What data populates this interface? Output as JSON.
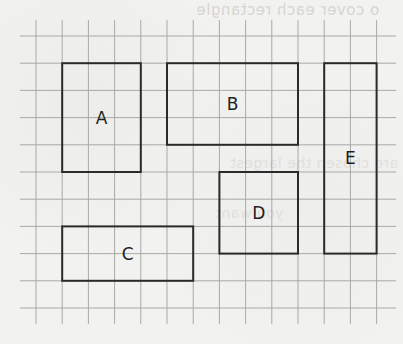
{
  "figure": {
    "type": "grid-diagram",
    "grid": {
      "columns": 14,
      "rows": 10,
      "cell_size_px": 26.2,
      "origin_px": [
        36,
        36
      ],
      "line_color": "#a9a9a6",
      "shape_stroke_color": "#2b2b2b",
      "background_color": "#f2f2f0"
    },
    "shapes": [
      {
        "label": "A",
        "col": 1,
        "row": 1,
        "width_cells": 3,
        "height_cells": 4
      },
      {
        "label": "B",
        "col": 5,
        "row": 1,
        "width_cells": 5,
        "height_cells": 3
      },
      {
        "label": "C",
        "col": 1,
        "row": 7,
        "width_cells": 5,
        "height_cells": 2
      },
      {
        "label": "D",
        "col": 7,
        "row": 5,
        "width_cells": 3,
        "height_cells": 3
      },
      {
        "label": "E",
        "col": 11,
        "row": 1,
        "width_cells": 2,
        "height_cells": 7
      }
    ]
  },
  "background_bleed_text": {
    "top": "o cover each rectangle",
    "middle": "are chosen the largest",
    "lower": "you want"
  }
}
